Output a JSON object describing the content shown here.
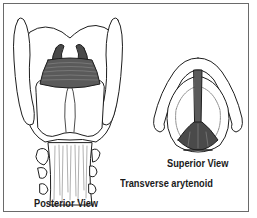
{
  "figure": {
    "colors": {
      "background": "#ffffff",
      "frame": "#6a6a6a",
      "outline": "#1e1e1e",
      "muscle_fill": "#5a5a5a",
      "muscle_striation": "#8a8a8a",
      "label_text": "#1a1a1a"
    },
    "panels": [
      {
        "id": "posterior",
        "label": "Posterior View"
      },
      {
        "id": "superior",
        "label": "Superior View"
      }
    ],
    "annotation": {
      "label": "Transverse arytenoid"
    }
  }
}
